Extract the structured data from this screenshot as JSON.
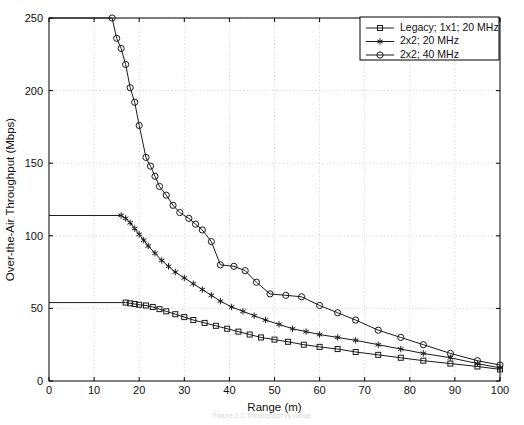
{
  "chart_data": {
    "type": "line",
    "title": "",
    "xlabel": "Range (m)",
    "ylabel": "Over-the-Air Throughput (Mbps)",
    "xlim": [
      0,
      100
    ],
    "ylim": [
      0,
      250
    ],
    "xticks": [
      0,
      10,
      20,
      30,
      40,
      50,
      60,
      70,
      80,
      90,
      100
    ],
    "yticks": [
      0,
      50,
      100,
      150,
      200,
      250
    ],
    "grid": true,
    "legend_position": "top-right",
    "series": [
      {
        "name": "Legacy; 1x1; 20 MHz",
        "marker": "square",
        "points": [
          [
            0,
            54
          ],
          [
            17,
            54
          ],
          [
            18,
            53.5
          ],
          [
            19,
            53
          ],
          [
            20,
            52.5
          ],
          [
            21.5,
            52
          ],
          [
            23,
            51
          ],
          [
            24.5,
            49.5
          ],
          [
            26,
            48
          ],
          [
            28,
            46
          ],
          [
            30,
            44
          ],
          [
            32,
            42
          ],
          [
            34.5,
            40
          ],
          [
            37,
            38
          ],
          [
            39.5,
            36
          ],
          [
            42,
            34
          ],
          [
            44.5,
            32
          ],
          [
            47,
            30
          ],
          [
            50,
            28.5
          ],
          [
            53,
            27
          ],
          [
            56.5,
            25
          ],
          [
            60,
            23.5
          ],
          [
            64,
            22
          ],
          [
            68,
            20
          ],
          [
            73,
            18
          ],
          [
            78,
            16
          ],
          [
            83,
            14
          ],
          [
            89,
            12
          ],
          [
            95,
            10
          ],
          [
            100,
            8
          ]
        ]
      },
      {
        "name": "2x2; 20 MHz",
        "marker": "star",
        "points": [
          [
            0,
            114
          ],
          [
            16,
            114
          ],
          [
            17,
            112
          ],
          [
            18,
            109
          ],
          [
            19,
            105
          ],
          [
            20,
            101
          ],
          [
            21,
            97
          ],
          [
            22,
            93
          ],
          [
            23.5,
            88
          ],
          [
            25,
            83
          ],
          [
            26.5,
            79
          ],
          [
            28,
            75
          ],
          [
            30,
            71
          ],
          [
            32,
            67
          ],
          [
            34,
            63
          ],
          [
            36,
            59
          ],
          [
            38,
            55
          ],
          [
            40.5,
            51
          ],
          [
            43,
            48
          ],
          [
            45.5,
            45
          ],
          [
            48,
            42
          ],
          [
            51,
            39
          ],
          [
            54,
            36
          ],
          [
            57,
            34
          ],
          [
            60,
            32
          ],
          [
            64,
            30
          ],
          [
            68,
            28
          ],
          [
            73,
            25
          ],
          [
            78,
            22
          ],
          [
            83,
            19
          ],
          [
            89,
            16
          ],
          [
            95,
            12
          ],
          [
            100,
            9
          ]
        ]
      },
      {
        "name": "2x2; 40 MHz",
        "marker": "circle",
        "points": [
          [
            0,
            250
          ],
          [
            14,
            250
          ],
          [
            15,
            236
          ],
          [
            16,
            229
          ],
          [
            17,
            218
          ],
          [
            18,
            202
          ],
          [
            19,
            192
          ],
          [
            20,
            176
          ],
          [
            21.5,
            154
          ],
          [
            22.5,
            148
          ],
          [
            23.5,
            141
          ],
          [
            24.5,
            134
          ],
          [
            26,
            128
          ],
          [
            27.5,
            121
          ],
          [
            29,
            116
          ],
          [
            31,
            112
          ],
          [
            32.5,
            108
          ],
          [
            34,
            104
          ],
          [
            36,
            96
          ],
          [
            38,
            80
          ],
          [
            41,
            79
          ],
          [
            43.5,
            76
          ],
          [
            46,
            68
          ],
          [
            49,
            60
          ],
          [
            52.5,
            59
          ],
          [
            56,
            58
          ],
          [
            60,
            52
          ],
          [
            64,
            47
          ],
          [
            68,
            42
          ],
          [
            73,
            35
          ],
          [
            78,
            30
          ],
          [
            83,
            25
          ],
          [
            89,
            19
          ],
          [
            95,
            14
          ],
          [
            100,
            11
          ]
        ]
      }
    ]
  },
  "caption": {
    "text": "Figure 2.1 Throughput vs range"
  }
}
